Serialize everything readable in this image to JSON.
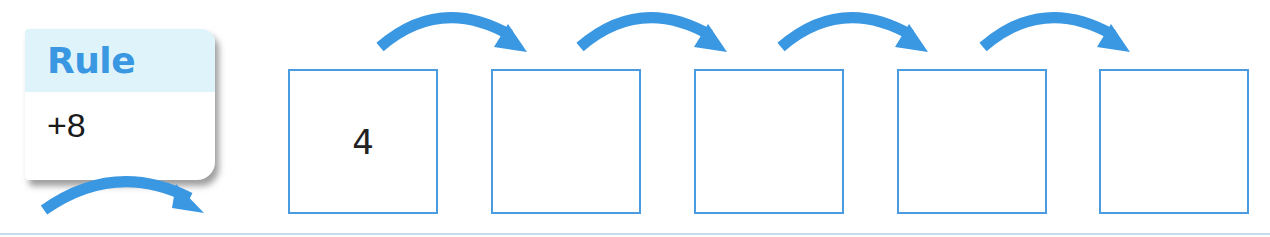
{
  "rule": {
    "title": "Rule",
    "value": "+8"
  },
  "sequence": {
    "boxes": [
      {
        "value": "4"
      },
      {
        "value": ""
      },
      {
        "value": ""
      },
      {
        "value": ""
      },
      {
        "value": ""
      }
    ]
  },
  "colors": {
    "accent": "#3a97e2",
    "box_border": "#4a9be0",
    "rule_header_bg": "#dff3fb"
  }
}
